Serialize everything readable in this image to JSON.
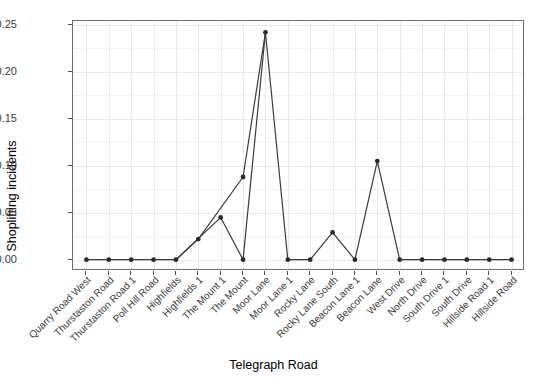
{
  "chart_data": {
    "type": "line",
    "title": "",
    "xlabel": "Telegraph Road",
    "ylabel": "Shoplifting incidents",
    "categories": [
      "Quarry Road West",
      "Thurstaston Road",
      "Thurstaston Road 1",
      "Poll Hill Road",
      "Highfields",
      "Highfields 1",
      "The Mount 1",
      "The Mount",
      "Moor Lane",
      "Moor Lane 1",
      "Rocky Lane",
      "Rocky Lane South",
      "Beacon Lane 1",
      "Beacon Lane",
      "West Drive",
      "North Drive",
      "South Drive 1",
      "South Drive",
      "Hillside Road 1",
      "Hillside Road"
    ],
    "values": [
      0.0,
      0.0,
      0.0,
      0.0,
      0.0,
      0.022,
      0.045,
      0.0,
      0.242,
      0.0,
      0.0,
      0.029,
      0.0,
      0.105,
      0.0,
      0.0,
      0.0,
      0.0,
      0.0,
      0.0
    ],
    "extra_points": [
      {
        "category": "The Mount",
        "value": 0.088
      }
    ],
    "path_order": [
      {
        "x": 0,
        "y": 0.0
      },
      {
        "x": 1,
        "y": 0.0
      },
      {
        "x": 2,
        "y": 0.0
      },
      {
        "x": 3,
        "y": 0.0
      },
      {
        "x": 4,
        "y": 0.0
      },
      {
        "x": 5,
        "y": 0.022
      },
      {
        "x": 7,
        "y": 0.088
      },
      {
        "x": 8,
        "y": 0.242
      },
      {
        "x": 9,
        "y": 0.0
      },
      {
        "x": 10,
        "y": 0.0
      },
      {
        "x": 11,
        "y": 0.029
      },
      {
        "x": 12,
        "y": 0.0
      },
      {
        "x": 13,
        "y": 0.105
      },
      {
        "x": 14,
        "y": 0.0
      },
      {
        "x": 15,
        "y": 0.0
      },
      {
        "x": 16,
        "y": 0.0
      },
      {
        "x": 17,
        "y": 0.0
      },
      {
        "x": 18,
        "y": 0.0
      },
      {
        "x": 19,
        "y": 0.0
      }
    ],
    "path_order_2": [
      {
        "x": 4,
        "y": 0.0
      },
      {
        "x": 6,
        "y": 0.045
      },
      {
        "x": 7,
        "y": 0.0
      },
      {
        "x": 8,
        "y": 0.242
      }
    ],
    "yticks": [
      "0.00",
      "0.05",
      "0.10",
      "0.15",
      "0.20",
      "0.25"
    ],
    "ytick_values": [
      0.0,
      0.05,
      0.1,
      0.15,
      0.2,
      0.25
    ],
    "ylim": [
      -0.012,
      0.254
    ],
    "grid": true,
    "legend": "none",
    "line_color": "#3a3a3a",
    "point_color": "#2b2b2b",
    "panel_background": "#ffffff",
    "grid_color": "#e9e9e9"
  }
}
